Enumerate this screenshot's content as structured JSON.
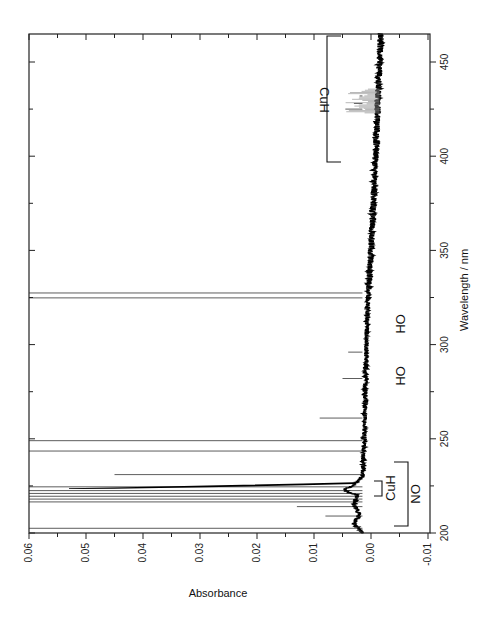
{
  "chart_data": {
    "type": "line",
    "orientation": "rotated-90-clockwise",
    "title": "",
    "xlabel": "Wavelength / nm",
    "ylabel": "Absorbance",
    "xlim": [
      200,
      465
    ],
    "ylim": [
      -0.01,
      0.06
    ],
    "x_ticks": [
      200,
      250,
      300,
      350,
      400,
      450
    ],
    "x_tick_labels": [
      "200",
      "250",
      "300",
      "350",
      "400",
      "450"
    ],
    "y_ticks": [
      0.06,
      0.05,
      0.04,
      0.03,
      0.02,
      0.01,
      0.0,
      -0.01
    ],
    "y_tick_labels": [
      "0.06",
      "0.05",
      "0.04",
      "0.03",
      "0.02",
      "0.01",
      "0.00",
      "-0.01"
    ],
    "grid": false,
    "legend": null,
    "series": [
      {
        "name": "Absorbance spectrum",
        "baseline": [
          {
            "x": 200,
            "y": 0.0015
          },
          {
            "x": 205,
            "y": 0.003
          },
          {
            "x": 210,
            "y": 0.002
          },
          {
            "x": 215,
            "y": 0.003
          },
          {
            "x": 220,
            "y": 0.0025
          },
          {
            "x": 223,
            "y": 0.005
          },
          {
            "x": 225,
            "y": 0.003
          },
          {
            "x": 230,
            "y": 0.0015
          },
          {
            "x": 250,
            "y": 0.0012
          },
          {
            "x": 300,
            "y": 0.0008
          },
          {
            "x": 320,
            "y": 0.0006
          },
          {
            "x": 350,
            "y": 0.0
          },
          {
            "x": 400,
            "y": -0.0008
          },
          {
            "x": 450,
            "y": -0.0015
          },
          {
            "x": 465,
            "y": -0.0017
          }
        ],
        "sharp_lines": [
          {
            "x": 202.5,
            "y": 0.06,
            "off_scale": true
          },
          {
            "x": 209,
            "y": 0.008
          },
          {
            "x": 214,
            "y": 0.013
          },
          {
            "x": 216.5,
            "y": 0.06,
            "off_scale": true
          },
          {
            "x": 218,
            "y": 0.06,
            "off_scale": true
          },
          {
            "x": 219.5,
            "y": 0.06,
            "off_scale": true
          },
          {
            "x": 221,
            "y": 0.06,
            "off_scale": true
          },
          {
            "x": 222.5,
            "y": 0.06,
            "off_scale": true
          },
          {
            "x": 224.5,
            "y": 0.06,
            "off_scale": true
          },
          {
            "x": 231,
            "y": 0.045
          },
          {
            "x": 243.5,
            "y": 0.06,
            "off_scale": true
          },
          {
            "x": 249,
            "y": 0.06,
            "off_scale": true
          },
          {
            "x": 261,
            "y": 0.009
          },
          {
            "x": 282,
            "y": 0.005
          },
          {
            "x": 296,
            "y": 0.004
          },
          {
            "x": 324.8,
            "y": 0.06,
            "off_scale": true
          },
          {
            "x": 327.4,
            "y": 0.06,
            "off_scale": true
          },
          {
            "x": 425,
            "y": 0.0045
          },
          {
            "x": 428,
            "y": 0.003
          },
          {
            "x": 432,
            "y": 0.002
          }
        ]
      }
    ],
    "annotations": [
      {
        "text": "NO",
        "type": "bracket",
        "x_range": [
          200,
          237
        ]
      },
      {
        "text": "CuH",
        "type": "bracket",
        "x_range": [
          220,
          226
        ]
      },
      {
        "text": "OH",
        "at_x": 282
      },
      {
        "text": "OH",
        "at_x": 309
      },
      {
        "text": "CuH",
        "type": "bracket",
        "x_range": [
          397,
          465
        ]
      }
    ]
  },
  "labels": {
    "xlabel": "Wavelength / nm",
    "ylabel": "Absorbance",
    "annot_no": "NO",
    "annot_cuh_small": "CuH",
    "annot_oh_1": "OH",
    "annot_oh_2": "OH",
    "annot_cuh_large": "CuH"
  }
}
